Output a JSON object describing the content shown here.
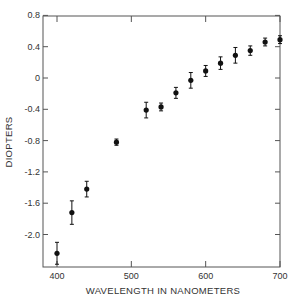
{
  "chart_data": {
    "type": "scatter",
    "title": "",
    "xlabel": "WAVELENGTH IN NANOMETERS",
    "ylabel": "DIOPTERS",
    "xlim": [
      380,
      705
    ],
    "ylim": [
      -2.41,
      0.8
    ],
    "x_ticks": [
      400,
      500,
      600,
      700
    ],
    "y_ticks": [
      0.8,
      0.4,
      0,
      -0.4,
      -0.8,
      -1.2,
      -1.6,
      -2.0
    ],
    "y_tick_labels": [
      "0.8",
      "0.4",
      "0",
      "-0.4",
      "-0.8",
      "-1.2",
      "-1.6",
      "-2.0"
    ],
    "grid": false,
    "series": [
      {
        "name": "Chromatic aberration",
        "x": [
          400,
          420,
          440,
          480,
          520,
          540,
          560,
          580,
          600,
          620,
          640,
          660,
          680,
          700
        ],
        "values": [
          -2.24,
          -1.72,
          -1.42,
          -0.82,
          -0.41,
          -0.37,
          -0.19,
          -0.03,
          0.09,
          0.19,
          0.29,
          0.35,
          0.46,
          0.49
        ],
        "error": [
          0.14,
          0.15,
          0.1,
          0.04,
          0.1,
          0.05,
          0.07,
          0.1,
          0.07,
          0.08,
          0.1,
          0.06,
          0.05,
          0.05
        ]
      }
    ]
  }
}
